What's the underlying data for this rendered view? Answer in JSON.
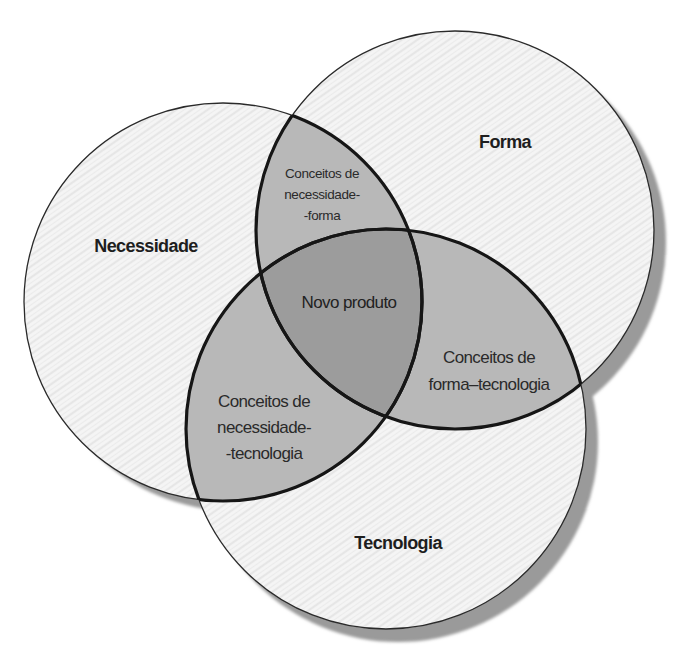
{
  "diagram": {
    "type": "venn",
    "sets": [
      {
        "id": "necessidade",
        "label": "Necessidade",
        "cx": 223,
        "cy": 302,
        "r": 199
      },
      {
        "id": "forma",
        "label": "Forma",
        "cx": 455,
        "cy": 230,
        "r": 199
      },
      {
        "id": "tecnologia",
        "label": "Tecnologia",
        "cx": 386,
        "cy": 429,
        "r": 200
      }
    ],
    "intersections": {
      "necessidade_forma": [
        "Conceitos de",
        "necessidade-",
        "-forma"
      ],
      "forma_tecnologia": [
        "Conceitos de",
        "forma–tecnologia"
      ],
      "necessidade_tecnologia": [
        "Conceitos de",
        "necessidade-",
        "-tecnologia"
      ],
      "all": "Novo produto"
    },
    "colors": {
      "set_fill": "#f4f4f4",
      "pair_fill": "#b7b7b7",
      "triple_fill": "#9b9b9b",
      "shadow": "#8f8f8f",
      "outline": "#1a1a1a"
    }
  }
}
